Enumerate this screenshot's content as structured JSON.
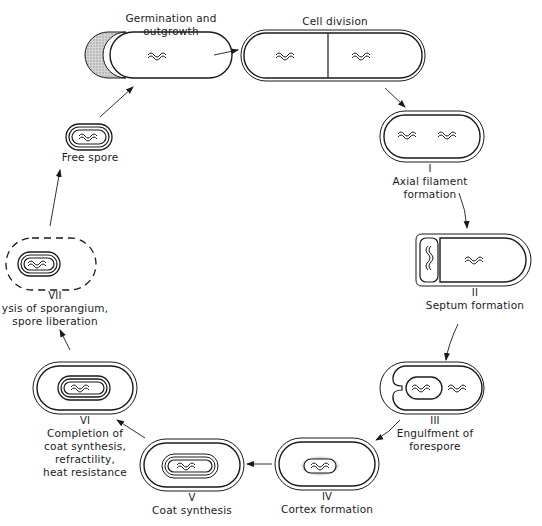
{
  "diagram": {
    "type": "cycle",
    "stages": [
      {
        "id": "germination",
        "numeral": "",
        "label": "Germination and\noutgrowth",
        "line1": "Germination and",
        "line2": "outgrowth"
      },
      {
        "id": "cell-division",
        "numeral": "",
        "label": "Cell division",
        "line1": "Cell division"
      },
      {
        "id": "stage-1",
        "numeral": "I",
        "line1": "Axial filament",
        "line2": "formation"
      },
      {
        "id": "stage-2",
        "numeral": "II",
        "line1": "Septum formation"
      },
      {
        "id": "stage-3",
        "numeral": "III",
        "line1": "Engulfment of",
        "line2": "forespore"
      },
      {
        "id": "stage-4",
        "numeral": "IV",
        "line1": "Cortex formation"
      },
      {
        "id": "stage-5",
        "numeral": "V",
        "line1": "Coat synthesis"
      },
      {
        "id": "stage-6",
        "numeral": "VI",
        "line1": "Completion of",
        "line2": "coat synthesis,",
        "line3": "refractility,",
        "line4": "heat resistance"
      },
      {
        "id": "stage-7",
        "numeral": "VII",
        "line1": "ysis of sporangium,",
        "line2": "spore liberation"
      },
      {
        "id": "free-spore",
        "numeral": "",
        "line1": "Free spore"
      }
    ],
    "flow": [
      "free-spore -> germination",
      "germination -> cell-division",
      "cell-division -> stage-1",
      "stage-1 -> stage-2",
      "stage-2 -> stage-3",
      "stage-3 -> stage-4",
      "stage-4 -> stage-5",
      "stage-5 -> stage-6",
      "stage-6 -> stage-7",
      "stage-7 -> free-spore"
    ],
    "colors": {
      "ink": "#1a1a1a",
      "background": "#ffffff",
      "shading": "#bdbdbd"
    }
  }
}
